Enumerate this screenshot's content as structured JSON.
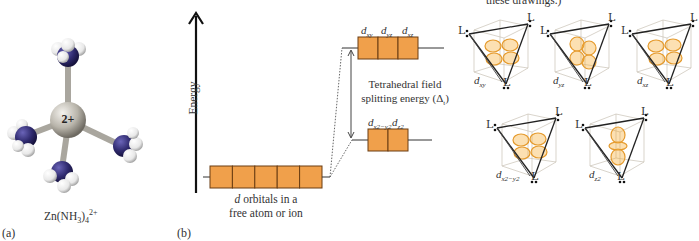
{
  "panel_a": {
    "label": "(a)",
    "formula": {
      "base": "Zn(NH",
      "sub3": "3",
      "close": ")",
      "sub4": "4",
      "charge": "2+"
    },
    "central_charge": "2+",
    "colors": {
      "zinc": "#b8b4aa",
      "nitrogen": "#2f2a6e",
      "hydrogen": "#f2f2f2",
      "bond": "#a9a69e"
    }
  },
  "panel_b": {
    "label": "(b)",
    "energy_axis_label": "Energy",
    "free_ion_caption_d": "d",
    "free_ion_caption_rest_line1": " orbitals in a",
    "free_ion_caption_line2": "free atom or ion",
    "free_ion_orbital_count": 5,
    "upper_set": {
      "labels": [
        {
          "d": "d",
          "sub": "xy"
        },
        {
          "d": "d",
          "sub": "yz"
        },
        {
          "d": "d",
          "sub": "xz"
        }
      ]
    },
    "lower_set": {
      "labels": [
        {
          "d": "d",
          "sub": "x2−y2"
        },
        {
          "d": "d",
          "sub": "z2"
        }
      ]
    },
    "splitting_label_line1": "Tetrahedral field",
    "splitting_label_line2": "splitting energy (Δ",
    "splitting_label_sub": "t",
    "splitting_label_close": ")",
    "colors": {
      "orbital_fill": "#f0a04b",
      "orbital_border": "#6b3d12",
      "line": "#333333"
    }
  },
  "top_note_fragment": "these drawings.)",
  "tetrahedra": {
    "ligand_label": "L",
    "items": [
      {
        "name": "dxy",
        "d": "d",
        "sub": "xy"
      },
      {
        "name": "dyz",
        "d": "d",
        "sub": "yz"
      },
      {
        "name": "dxz",
        "d": "d",
        "sub": "xz"
      },
      {
        "name": "dx2-y2",
        "d": "d",
        "sub": "x2−y2"
      },
      {
        "name": "dz2",
        "d": "d",
        "sub": "z2"
      }
    ],
    "lobe_color": "#f5a623"
  }
}
